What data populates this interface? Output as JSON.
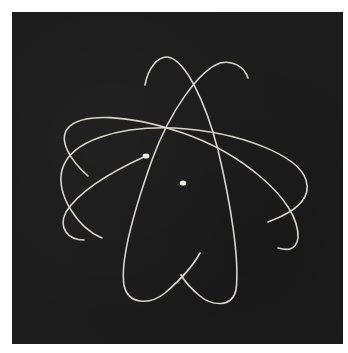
{
  "image": {
    "subject": "Atom symbol: three elliptical electron orbits around a nucleus",
    "background_color": "#1c1c1c",
    "frame_color": "#ffffff",
    "orbit_color": "#d8d4cc",
    "elements": {
      "orbits": 3,
      "nucleus": {
        "cx": 183,
        "cy": 183,
        "r": 3
      },
      "electron": {
        "cx": 146,
        "cy": 156,
        "r": 3
      }
    }
  }
}
